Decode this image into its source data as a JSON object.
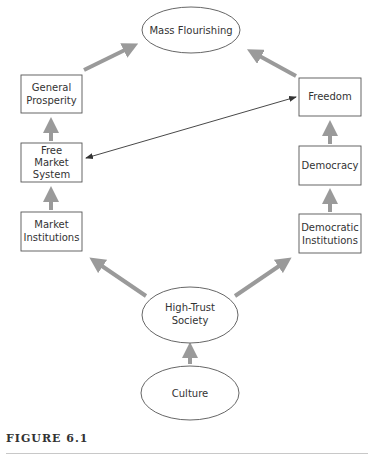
{
  "diagram": {
    "colors": {
      "box_stroke": "#555555",
      "thick_arrow": "#9a9a9a",
      "thin_arrow": "#333333",
      "text": "#333333"
    },
    "nodes": {
      "mass_flourishing": {
        "shape": "ellipse",
        "lines": [
          "Mass Flourishing"
        ]
      },
      "general_prosperity": {
        "shape": "box",
        "lines": [
          "General",
          "Prosperity"
        ]
      },
      "free_market_system": {
        "shape": "box",
        "lines": [
          "Free",
          "Market",
          "System"
        ]
      },
      "market_institutions": {
        "shape": "box",
        "lines": [
          "Market",
          "Institutions"
        ]
      },
      "freedom": {
        "shape": "box",
        "lines": [
          "Freedom"
        ]
      },
      "democracy": {
        "shape": "box",
        "lines": [
          "Democracy"
        ]
      },
      "democratic_institutions": {
        "shape": "box",
        "lines": [
          "Democratic",
          "Institutions"
        ]
      },
      "high_trust_society": {
        "shape": "ellipse",
        "lines": [
          "High-Trust",
          "Society"
        ]
      },
      "culture": {
        "shape": "ellipse",
        "lines": [
          "Culture"
        ]
      }
    },
    "edges": [
      {
        "from": "culture",
        "to": "high_trust_society",
        "style": "thick"
      },
      {
        "from": "high_trust_society",
        "to": "market_institutions",
        "style": "thick"
      },
      {
        "from": "high_trust_society",
        "to": "democratic_institutions",
        "style": "thick"
      },
      {
        "from": "market_institutions",
        "to": "free_market_system",
        "style": "thick"
      },
      {
        "from": "free_market_system",
        "to": "general_prosperity",
        "style": "thick"
      },
      {
        "from": "general_prosperity",
        "to": "mass_flourishing",
        "style": "thick"
      },
      {
        "from": "democratic_institutions",
        "to": "democracy",
        "style": "thick"
      },
      {
        "from": "democracy",
        "to": "freedom",
        "style": "thick"
      },
      {
        "from": "freedom",
        "to": "mass_flourishing",
        "style": "thick"
      },
      {
        "from": "free_market_system",
        "to": "freedom",
        "style": "thin-bidirectional"
      }
    ]
  },
  "caption": {
    "label": "FIGURE 6.1"
  }
}
